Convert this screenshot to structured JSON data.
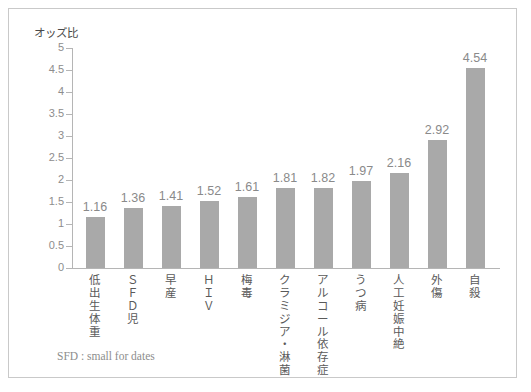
{
  "figure": {
    "background_color": "#ffffff",
    "border_color": "#c9c9c9",
    "bar_color": "#a9a9a9",
    "axis_color": "#b5b5b5",
    "tick_label_color": "#8d8d8d",
    "value_label_color": "#8a8a8a",
    "category_label_color": "#5a5a5a",
    "footnote_text": "SFD : small for dates"
  },
  "chart_data": {
    "type": "bar",
    "title": "",
    "xlabel": "",
    "ylabel": "オッズ比",
    "ylim": [
      0,
      5
    ],
    "yticks": [
      "0",
      "0.5",
      "1",
      "1.5",
      "2",
      "2.5",
      "3",
      "3.5",
      "4",
      "4.5",
      "5"
    ],
    "ytick_values": [
      0,
      0.5,
      1,
      1.5,
      2,
      2.5,
      3,
      3.5,
      4,
      4.5,
      5
    ],
    "grid": false,
    "legend": false,
    "orientation": "vertical",
    "categories": [
      "低出生体重",
      "ＳＦＤ児",
      "早産",
      "ＨＩＶ",
      "梅毒",
      "クラミジア・淋菌",
      "アルコール依存症",
      "うつ病",
      "人工妊娠中絶",
      "外傷",
      "自殺"
    ],
    "values": [
      1.16,
      1.36,
      1.41,
      1.52,
      1.61,
      1.81,
      1.82,
      1.97,
      2.16,
      2.92,
      4.54
    ],
    "value_labels": [
      "1.16",
      "1.36",
      "1.41",
      "1.52",
      "1.61",
      "1.81",
      "1.82",
      "1.97",
      "2.16",
      "2.92",
      "4.54"
    ],
    "annotations": [
      "SFD : small for dates"
    ]
  }
}
